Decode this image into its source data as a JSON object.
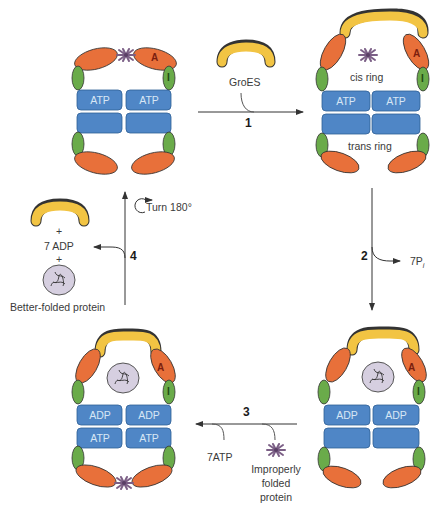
{
  "diagram": {
    "colors": {
      "apical_domain": "#e8703a",
      "intermediate_domain": "#6aab4a",
      "equatorial_domain": "#4f86c6",
      "groes": "#f2c443",
      "protein_blob": "#cfc6d8",
      "unfolded_protein": "#8b6f95",
      "arrow": "#4a4a4a"
    },
    "steps": [
      {
        "number": "1",
        "side_label": "GroES"
      },
      {
        "number": "2",
        "side_label": "7P",
        "side_label_sub": "i"
      },
      {
        "number": "3",
        "side_labels": [
          "7ATP",
          "Improperly",
          "folded",
          "protein"
        ]
      },
      {
        "number": "4",
        "rotation_label": "Turn 180°"
      }
    ],
    "release_products": {
      "plus1": "+",
      "adp": "7 ADP",
      "plus2": "+",
      "protein_label": "Better-folded protein"
    },
    "complexes": {
      "top_left": {
        "domain_labels": [
          "A",
          "I"
        ],
        "upper_ring": [
          "ATP",
          "ATP"
        ],
        "lower_ring": [
          "",
          ""
        ]
      },
      "top_right": {
        "domain_labels": [
          "A",
          "I"
        ],
        "ring_labels": [
          "cis ring",
          "trans ring"
        ],
        "upper_ring": [
          "ATP",
          "ATP"
        ],
        "lower_ring": [
          "",
          ""
        ]
      },
      "bottom_right": {
        "domain_labels": [
          "A",
          "I"
        ],
        "upper_ring": [
          "ADP",
          "ADP"
        ],
        "lower_ring": [
          "",
          ""
        ]
      },
      "bottom_left": {
        "domain_labels": [
          "A",
          "I"
        ],
        "upper_ring": [
          "ADP",
          "ADP"
        ],
        "lower_ring": [
          "ATP",
          "ATP"
        ]
      }
    }
  }
}
